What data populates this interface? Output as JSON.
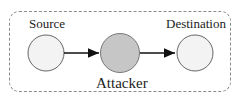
{
  "diagram": {
    "nodes": [
      {
        "id": "source",
        "label": "Source",
        "fill": "#f3f3f3"
      },
      {
        "id": "attacker",
        "label": "Attacker",
        "fill": "#c6c6c6"
      },
      {
        "id": "destination",
        "label": "Destination",
        "fill": "#f3f3f3"
      }
    ],
    "edges": [
      {
        "from": "source",
        "to": "attacker"
      },
      {
        "from": "attacker",
        "to": "destination"
      }
    ]
  }
}
